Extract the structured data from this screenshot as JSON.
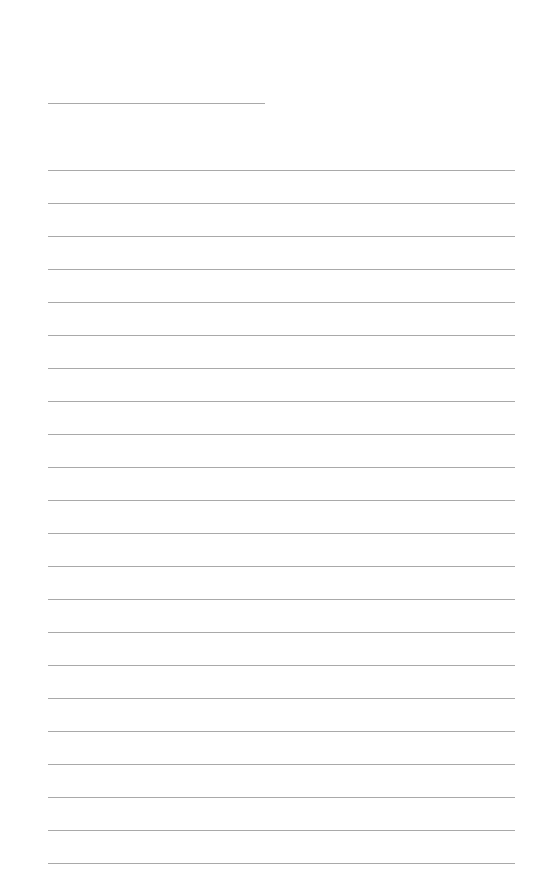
{
  "page": {
    "type": "lined-paper",
    "background": "#ffffff",
    "line_color": "#9a9a9a",
    "header_line": {
      "top": 103,
      "left": 48,
      "width": 217
    },
    "ruled_lines": {
      "count": 22,
      "first_top": 170,
      "spacing": 33,
      "left": 48,
      "width": 467
    }
  }
}
